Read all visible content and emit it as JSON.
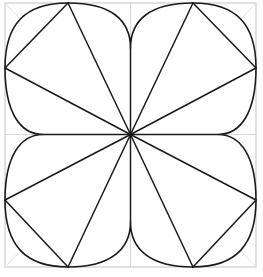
{
  "figure": {
    "type": "line-drawing",
    "canvas": {
      "width": 263,
      "height": 277,
      "background": "#ffffff"
    },
    "colors": {
      "outline": "#1a1a1a",
      "guide": "#c9c9c9",
      "guide_faint": "#dcdcdc",
      "fill": "#ffffff",
      "background": "#ffffff"
    },
    "stroke_widths": {
      "outline": 1.6,
      "ray": 1.5,
      "guide": 0.8
    },
    "geometry": {
      "square": {
        "left": 5,
        "top": 3,
        "right": 256,
        "bottom": 267
      },
      "center": {
        "x": 130.5,
        "y": 134.5
      },
      "edge_vertices": [
        {
          "name": "top-left-vertex",
          "x": 68,
          "y": 3
        },
        {
          "name": "top-right-vertex",
          "x": 193,
          "y": 3
        },
        {
          "name": "right-top-vertex",
          "x": 256,
          "y": 68
        },
        {
          "name": "right-bottom-vertex",
          "x": 256,
          "y": 200
        },
        {
          "name": "bottom-right-vertex",
          "x": 193,
          "y": 267
        },
        {
          "name": "bottom-left-vertex",
          "x": 68,
          "y": 267
        },
        {
          "name": "left-bottom-vertex",
          "x": 5,
          "y": 200
        },
        {
          "name": "left-top-vertex",
          "x": 5,
          "y": 68
        }
      ],
      "cusps": [
        {
          "name": "top-cusp",
          "x": 130.5,
          "y": 48
        },
        {
          "name": "right-cusp",
          "x": 218,
          "y": 134.5
        },
        {
          "name": "bottom-cusp",
          "x": 130.5,
          "y": 222
        },
        {
          "name": "left-cusp",
          "x": 43,
          "y": 134.5
        }
      ],
      "petal_count": 4,
      "ray_count": 12,
      "arc_count": 8
    },
    "guides": {
      "diagonals": [
        {
          "name": "diagonal-tl-br",
          "x1": 5,
          "y1": 3,
          "x2": 256,
          "y2": 267
        },
        {
          "name": "diagonal-tr-bl",
          "x1": 256,
          "y1": 3,
          "x2": 5,
          "y2": 267
        }
      ],
      "axes": [
        {
          "name": "horizontal-axis",
          "x1": 5,
          "y1": 134.5,
          "x2": 256,
          "y2": 134.5
        },
        {
          "name": "vertical-axis",
          "x1": 130.5,
          "y1": 3,
          "x2": 130.5,
          "y2": 267
        }
      ]
    },
    "rays": [
      {
        "name": "ray-to-top-left-vertex",
        "x": 68,
        "y": 3
      },
      {
        "name": "ray-to-top-right-vertex",
        "x": 193,
        "y": 3
      },
      {
        "name": "ray-to-right-top-vertex",
        "x": 256,
        "y": 68
      },
      {
        "name": "ray-to-right-bottom-vertex",
        "x": 256,
        "y": 200
      },
      {
        "name": "ray-to-bottom-right-vertex",
        "x": 193,
        "y": 267
      },
      {
        "name": "ray-to-bottom-left-vertex",
        "x": 68,
        "y": 267
      },
      {
        "name": "ray-to-left-bottom-vertex",
        "x": 5,
        "y": 200
      },
      {
        "name": "ray-to-left-top-vertex",
        "x": 5,
        "y": 68
      },
      {
        "name": "ray-to-top-cusp",
        "x": 130.5,
        "y": 48
      },
      {
        "name": "ray-to-right-cusp",
        "x": 218,
        "y": 134.5
      },
      {
        "name": "ray-to-bottom-cusp",
        "x": 130.5,
        "y": 222
      },
      {
        "name": "ray-to-left-cusp",
        "x": 43,
        "y": 134.5
      }
    ],
    "petal_path": "M 130.5 48 C 130.5 18 148 3 193 3 C 238 3 256 22 256 68 C 256 110 240 134.5 218 134.5 C 240 134.5 256 159 256 200 C 256 247 238 267 193 267 C 148 267 130.5 250 130.5 222 C 130.5 250 113 267 68 267 C 23 267 5 247 5 200 C 5 159 21 134.5 43 134.5 C 21 134.5 5 110 5 68 C 5 22 23 3 68 3 C 113 3 130.5 18 130.5 48 Z"
  }
}
